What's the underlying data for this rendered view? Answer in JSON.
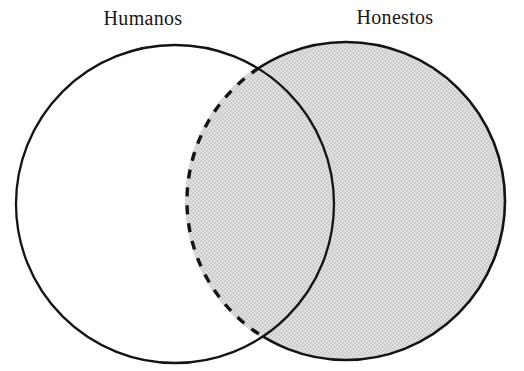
{
  "figure": {
    "type": "venn-diagram",
    "background_color": "#ffffff",
    "stroke_color": "#141414",
    "shaded_fill_color": "#d8d8d8",
    "unshaded_fill_color": "#ffffff",
    "language": "es"
  },
  "labels": {
    "left": "Humanos",
    "right": "Honestos"
  },
  "sets": [
    {
      "id": "left-set",
      "name": "Humanos",
      "outline_style": "solid",
      "fill": "none",
      "center_x": 175,
      "center_y": 204,
      "radius": 159
    },
    {
      "id": "right-set",
      "name": "Honestos",
      "outline_style": "dashed-left-solid-right",
      "fill": "#d8d8d8",
      "center_x": 346,
      "center_y": 201,
      "radius": 159
    }
  ],
  "regions": {
    "left_only": {
      "name": "Humanos only",
      "shaded": false
    },
    "intersection": {
      "name": "Humanos and Honestos",
      "shaded": true
    },
    "right_only": {
      "name": "Honestos only",
      "shaded": true
    }
  },
  "intersection_points": [
    {
      "x": 265,
      "y": 67
    },
    {
      "x": 265,
      "y": 339
    }
  ]
}
